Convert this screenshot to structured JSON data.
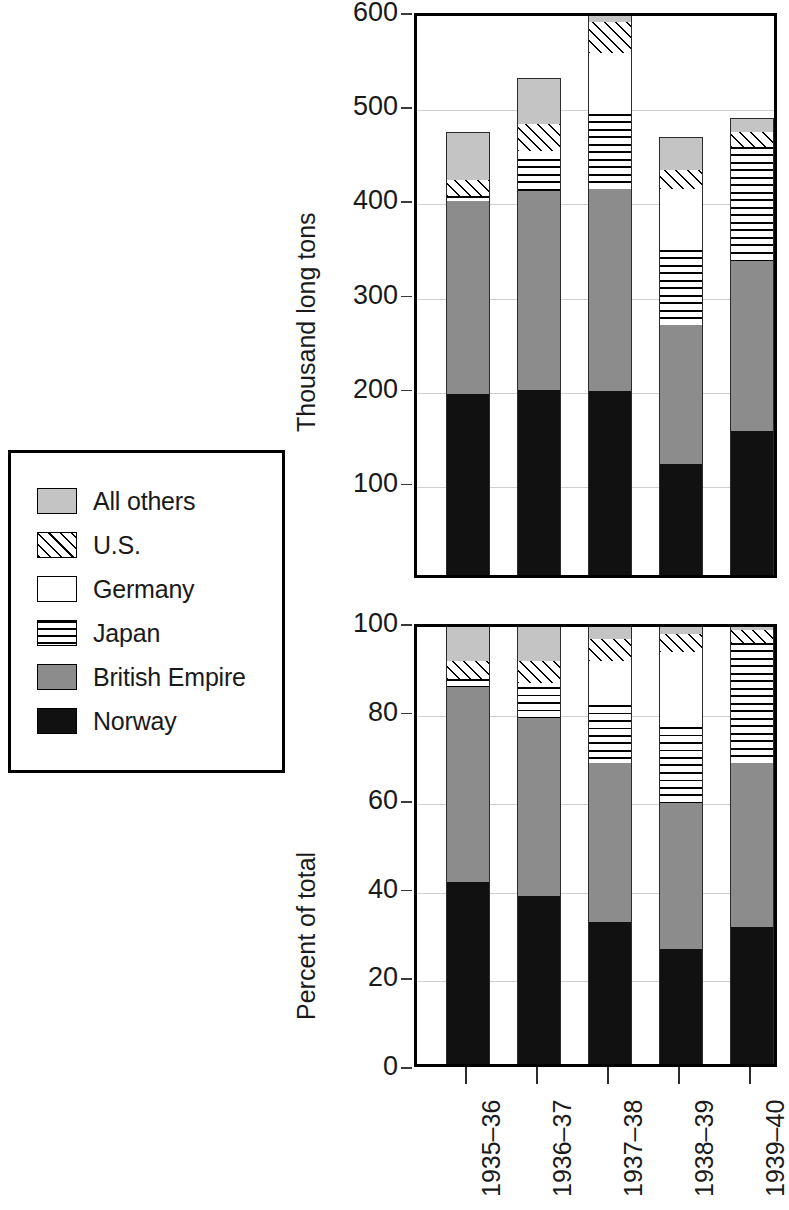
{
  "legend": {
    "items": [
      {
        "label": "All others",
        "key": "allothers",
        "pattern": "solid-light-gray",
        "color": "#c4c4c4"
      },
      {
        "label": "U.S.",
        "key": "us",
        "pattern": "diagonal-hatch",
        "color": "#ffffff"
      },
      {
        "label": "Germany",
        "key": "germany",
        "pattern": "solid-white",
        "color": "#ffffff"
      },
      {
        "label": "Japan",
        "key": "japan",
        "pattern": "horizontal-hatch",
        "color": "#ffffff"
      },
      {
        "label": "British Empire",
        "key": "britishempire",
        "pattern": "solid-mid-gray",
        "color": "#8c8c8c"
      },
      {
        "label": "Norway",
        "key": "norway",
        "pattern": "solid-black",
        "color": "#111111"
      }
    ]
  },
  "chart_data": [
    {
      "id": "top",
      "type": "bar",
      "stacked": true,
      "title": "",
      "xlabel": "",
      "ylabel": "Thousand long tons",
      "ylim": [
        0,
        600
      ],
      "yticks": [
        100,
        200,
        300,
        400,
        500,
        600
      ],
      "ytick_labels": [
        "100",
        "200",
        "300",
        "400",
        "500",
        "600"
      ],
      "grid": true,
      "legend_position": "left-outside",
      "categories": [
        "1935–36",
        "1936–37",
        "1937–38",
        "1938–39",
        "1939–40"
      ],
      "note": "1937-38 bar is clipped at the top of the axis",
      "series": [
        {
          "name": "Norway",
          "values": [
            192,
            196,
            195,
            118,
            153
          ]
        },
        {
          "name": "British Empire",
          "values": [
            205,
            212,
            215,
            148,
            180
          ]
        },
        {
          "name": "Japan",
          "values": [
            6,
            34,
            80,
            79,
            122
          ]
        },
        {
          "name": "Germany",
          "values": [
            0,
            8,
            64,
            65,
            0
          ]
        },
        {
          "name": "U.S.",
          "values": [
            16,
            29,
            33,
            20,
            15
          ]
        },
        {
          "name": "All others",
          "values": [
            51,
            49,
            38,
            35,
            15
          ]
        }
      ],
      "totals": [
        470,
        528,
        625,
        465,
        485
      ]
    },
    {
      "id": "bottom",
      "type": "bar",
      "stacked": true,
      "title": "",
      "xlabel": "",
      "ylabel": "Percent of total",
      "ylim": [
        0,
        100
      ],
      "yticks": [
        0,
        20,
        40,
        60,
        80,
        100
      ],
      "ytick_labels": [
        "0",
        "20",
        "40",
        "60",
        "80",
        "100"
      ],
      "grid": true,
      "legend_position": "left-outside",
      "categories": [
        "1935–36",
        "1936–37",
        "1937–38",
        "1938–39",
        "1939–40"
      ],
      "series": [
        {
          "name": "Norway",
          "values": [
            41,
            38,
            32,
            26,
            31
          ]
        },
        {
          "name": "British Empire",
          "values": [
            44,
            40,
            36,
            33,
            37
          ]
        },
        {
          "name": "Japan",
          "values": [
            2,
            7,
            13,
            17,
            27
          ]
        },
        {
          "name": "Germany",
          "values": [
            0,
            1,
            10,
            17,
            0
          ]
        },
        {
          "name": "U.S.",
          "values": [
            4,
            5,
            5,
            4,
            3
          ]
        },
        {
          "name": "All others",
          "values": [
            9,
            9,
            4,
            3,
            2
          ]
        }
      ],
      "totals": [
        100,
        100,
        100,
        100,
        100
      ]
    }
  ]
}
